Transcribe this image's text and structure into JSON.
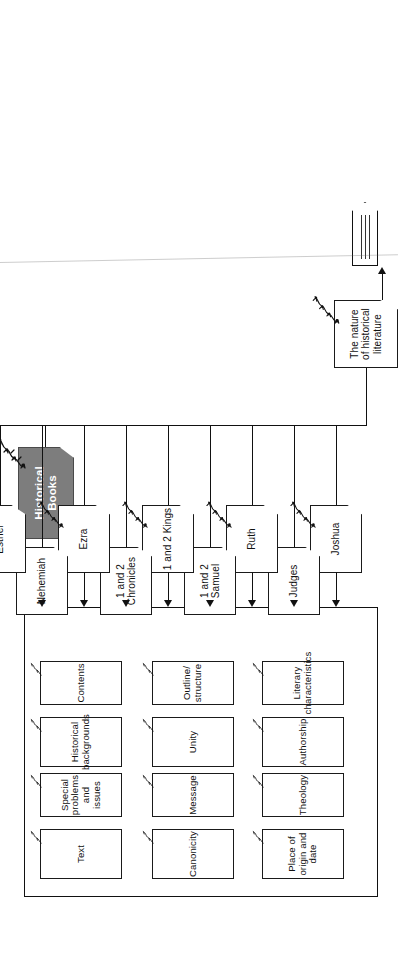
{
  "diagram": {
    "type": "tree-flowchart",
    "orientation": "rotated-90-counterclockwise",
    "root": {
      "label": "Historical Books",
      "fill": "#7d7d7d",
      "text_color": "#ffffff"
    },
    "note": {
      "label": "The nature of historical literature"
    },
    "pennant": {
      "label": "111",
      "rules": 3
    },
    "books": [
      {
        "label": "Joshua"
      },
      {
        "label": "Judges"
      },
      {
        "label": "Ruth"
      },
      {
        "label": "1 and 2 Samuel"
      },
      {
        "label": "1 and 2 Kings"
      },
      {
        "label": "1 and 2 Chronicles"
      },
      {
        "label": "Ezra"
      },
      {
        "label": "Nehemiah"
      },
      {
        "label": "Esther"
      }
    ],
    "panel": {
      "topics_row_a": [
        {
          "label": "Authorship"
        },
        {
          "label": "Unity"
        },
        {
          "label": "Historical backgrounds"
        },
        {
          "label": "Place of origin and date"
        },
        {
          "label": "Canonicity"
        },
        {
          "label": "Text"
        }
      ],
      "topics_row_b": [
        {
          "label": "Literary characteristics"
        },
        {
          "label": "Outline/ structure"
        },
        {
          "label": "Contents"
        },
        {
          "label": "Theology"
        },
        {
          "label": "Message"
        },
        {
          "label": "Special problems and issues"
        }
      ]
    },
    "icons": {
      "node_decoration": "castle-crown-icon",
      "arrow": "arrow-right-icon"
    },
    "colors": {
      "line": "#111111",
      "node_border": "#1a1a1a",
      "root_fill": "#7d7d7d",
      "paper": "#ffffff"
    }
  }
}
